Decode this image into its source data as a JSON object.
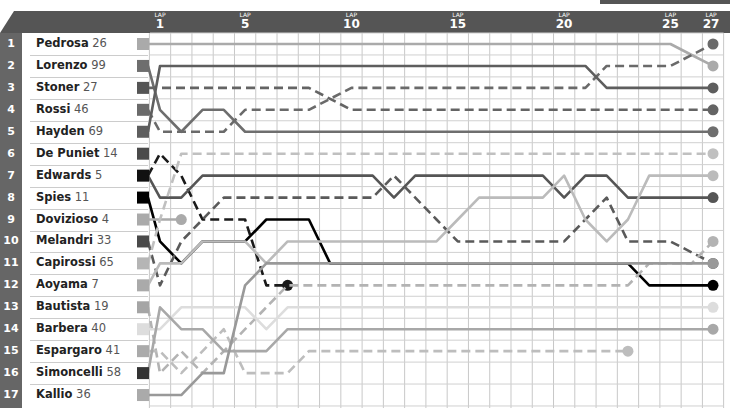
{
  "chart_data": {
    "type": "line",
    "title": "",
    "xlabel": "LAP",
    "ylabel": "Position",
    "x_ticks": [
      1,
      5,
      10,
      15,
      20,
      25,
      27
    ],
    "x_tick_prefix": "LAP",
    "ylim": [
      1,
      17
    ],
    "grid": true,
    "laps": [
      0,
      1,
      2,
      3,
      4,
      5,
      6,
      7,
      8,
      9,
      10,
      11,
      12,
      13,
      14,
      15,
      16,
      17,
      18,
      19,
      20,
      21,
      22,
      23,
      24,
      25,
      26,
      27
    ],
    "series": [
      {
        "name": "Pedrosa",
        "number": "26",
        "grid": 1,
        "color": "#aaaaaa",
        "dash": false,
        "positions": [
          1,
          1,
          1,
          1,
          1,
          1,
          1,
          1,
          1,
          1,
          1,
          1,
          1,
          1,
          1,
          1,
          1,
          1,
          1,
          1,
          1,
          1,
          1,
          1,
          1,
          1,
          1.5,
          2
        ]
      },
      {
        "name": "Lorenzo",
        "number": "99",
        "grid": 2,
        "color": "#6e6e6e",
        "dash": false,
        "positions": [
          2,
          4,
          5,
          4,
          4,
          5,
          5,
          5,
          5,
          5,
          5,
          5,
          5,
          5,
          5,
          5,
          5,
          5,
          5,
          5,
          5,
          5,
          5,
          5,
          5,
          5,
          5,
          5
        ]
      },
      {
        "name": "Stoner",
        "number": "27",
        "grid": 3,
        "color": "#646464",
        "dash": true,
        "positions": [
          3,
          3,
          3,
          3,
          3,
          3,
          3,
          3,
          3,
          3.5,
          4,
          4,
          4,
          4,
          4,
          4,
          4,
          4,
          4,
          4,
          4,
          4,
          4,
          4,
          4,
          4,
          4,
          4
        ]
      },
      {
        "name": "Rossi",
        "number": "46",
        "grid": 4,
        "color": "#6a6a6a",
        "dash": true,
        "positions": [
          4,
          5,
          5,
          5,
          5,
          4,
          4,
          4,
          4,
          3.5,
          3,
          3,
          3,
          3,
          3,
          3,
          3,
          3,
          3,
          3,
          3,
          3,
          2,
          2,
          2,
          2,
          1.5,
          1
        ]
      },
      {
        "name": "Hayden",
        "number": "69",
        "grid": 5,
        "color": "#5e5e5e",
        "dash": false,
        "positions": [
          5,
          2,
          2,
          2,
          2,
          2,
          2,
          2,
          2,
          2,
          2,
          2,
          2,
          2,
          2,
          2,
          2,
          2,
          2,
          2,
          2,
          2,
          3,
          3,
          3,
          3,
          3,
          3
        ]
      },
      {
        "name": "De Puniet",
        "number": "14",
        "grid": 6,
        "color": "#1a1a1a",
        "dash": true,
        "positions": [
          7,
          6,
          7,
          9,
          9,
          9,
          12,
          12,
          null,
          null,
          null,
          null,
          null,
          null,
          null,
          null,
          null,
          null,
          null,
          null,
          null,
          null,
          null,
          null,
          null,
          null,
          null,
          null
        ],
        "retired": true
      },
      {
        "name": "Edwards",
        "number": "5",
        "grid": 7,
        "color": "#555555",
        "dash": false,
        "positions": [
          7,
          8,
          8,
          7,
          7,
          7,
          7,
          7,
          7,
          7,
          7,
          7,
          8,
          7,
          7,
          7,
          7,
          7,
          7,
          7,
          8,
          7,
          7,
          8,
          8,
          8,
          8,
          8
        ]
      },
      {
        "name": "Spies",
        "number": "11",
        "grid": 8,
        "color": "#000000",
        "dash": false,
        "positions": [
          8,
          10,
          11,
          10,
          10,
          10,
          9,
          9,
          9,
          11,
          11,
          11,
          11,
          11,
          11,
          11,
          11,
          11,
          11,
          11,
          11,
          11,
          11,
          11,
          12,
          12,
          12,
          12
        ]
      },
      {
        "name": "Dovizioso",
        "number": "4",
        "grid": 9,
        "color": "#aaaaaa",
        "dash": false,
        "positions": [
          9,
          9,
          9,
          null,
          null,
          null,
          null,
          null,
          null,
          null,
          null,
          null,
          null,
          null,
          null,
          null,
          null,
          null,
          null,
          null,
          null,
          null,
          null,
          null,
          null,
          null,
          null,
          null
        ],
        "retired": true
      },
      {
        "name": "Melandri",
        "number": "33",
        "grid": 10,
        "color": "#5a5a5a",
        "dash": true,
        "positions": [
          10,
          12,
          10,
          9,
          8,
          8,
          8,
          8,
          8,
          8,
          8,
          8,
          7,
          8,
          9,
          10,
          10,
          10,
          10,
          10,
          10,
          9,
          8,
          10,
          10,
          10,
          10.5,
          11
        ]
      },
      {
        "name": "Capirossi",
        "number": "65",
        "grid": 11,
        "color": "#c0c0c0",
        "dash": true,
        "positions": [
          11,
          9,
          6,
          6,
          6,
          6,
          6,
          6,
          6,
          6,
          6,
          6,
          6,
          6,
          6,
          6,
          6,
          6,
          6,
          6,
          6,
          6,
          6,
          6,
          6,
          6,
          6,
          6
        ]
      },
      {
        "name": "Aoyama",
        "number": "7",
        "grid": 12,
        "color": "#bbbbbb",
        "dash": false,
        "positions": [
          12,
          11,
          11,
          10,
          10,
          10,
          11,
          10,
          10,
          10,
          10,
          10,
          10,
          10,
          10,
          9,
          8,
          8,
          8,
          8,
          7,
          9,
          10,
          9,
          7,
          7,
          7,
          7
        ]
      },
      {
        "name": "Bautista",
        "number": "19",
        "grid": 13,
        "color": "#b3b3b3",
        "dash": true,
        "positions": [
          13,
          16,
          15,
          16,
          15,
          14,
          13,
          12,
          12,
          12,
          12,
          12,
          12,
          12,
          12,
          12,
          12,
          12,
          12,
          12,
          12,
          12,
          12,
          12,
          11,
          11,
          11,
          10
        ]
      },
      {
        "name": "Barbera",
        "number": "40",
        "grid": 14,
        "color": "#dddddd",
        "dash": false,
        "positions": [
          14,
          14,
          13,
          13,
          13,
          13,
          14,
          13,
          13,
          13,
          13,
          13,
          13,
          13,
          13,
          13,
          13,
          13,
          13,
          13,
          13,
          13,
          13,
          13,
          13,
          13,
          13,
          13
        ]
      },
      {
        "name": "Espargaro",
        "number": "41",
        "grid": 15,
        "color": "#bdbdbd",
        "dash": true,
        "positions": [
          15,
          15,
          16,
          15,
          14,
          16,
          16,
          16,
          15,
          15,
          15,
          15,
          15,
          15,
          15,
          15,
          15,
          15,
          15,
          15,
          15,
          15,
          15,
          15,
          null,
          null,
          null,
          null
        ],
        "retired": true
      },
      {
        "name": "Simoncelli",
        "number": "58",
        "grid": 16,
        "color": "#a8a8a8",
        "dash": false,
        "positions": [
          16,
          13,
          14,
          14,
          15,
          15,
          15,
          14,
          14,
          14,
          14,
          14,
          14,
          14,
          14,
          14,
          14,
          14,
          14,
          14,
          14,
          14,
          14,
          14,
          14,
          14,
          14,
          14
        ]
      },
      {
        "name": "Kallio",
        "number": "36",
        "grid": 17,
        "color": "#999999",
        "dash": false,
        "positions": [
          17,
          17,
          17,
          16,
          16,
          12,
          11,
          11,
          11,
          11,
          11,
          11,
          11,
          11,
          11,
          11,
          11,
          11,
          11,
          11,
          11,
          11,
          11,
          11,
          11,
          11,
          11,
          11
        ]
      }
    ]
  },
  "header": {
    "lap_label": "LAP"
  },
  "rows": [
    {
      "pos": "1",
      "name": "Pedrosa",
      "number": "26",
      "color": "#aaaaaa"
    },
    {
      "pos": "2",
      "name": "Lorenzo",
      "number": "99",
      "color": "#6e6e6e"
    },
    {
      "pos": "3",
      "name": "Stoner",
      "number": "27",
      "color": "#555555"
    },
    {
      "pos": "4",
      "name": "Rossi",
      "number": "46",
      "color": "#6a6a6a"
    },
    {
      "pos": "5",
      "name": "Hayden",
      "number": "69",
      "color": "#5e5e5e"
    },
    {
      "pos": "6",
      "name": "De Puniet",
      "number": "14",
      "color": "#4a4a4a"
    },
    {
      "pos": "7",
      "name": "Edwards",
      "number": "5",
      "color": "#111111"
    },
    {
      "pos": "8",
      "name": "Spies",
      "number": "11",
      "color": "#000000"
    },
    {
      "pos": "9",
      "name": "Dovizioso",
      "number": "4",
      "color": "#aaaaaa"
    },
    {
      "pos": "10",
      "name": "Melandri",
      "number": "33",
      "color": "#4a4a4a"
    },
    {
      "pos": "11",
      "name": "Capirossi",
      "number": "65",
      "color": "#b5b5b5"
    },
    {
      "pos": "12",
      "name": "Aoyama",
      "number": "7",
      "color": "#aaaaaa"
    },
    {
      "pos": "13",
      "name": "Bautista",
      "number": "19",
      "color": "#a5a5a5"
    },
    {
      "pos": "14",
      "name": "Barbera",
      "number": "40",
      "color": "#dddddd"
    },
    {
      "pos": "15",
      "name": "Espargaro",
      "number": "41",
      "color": "#aaaaaa"
    },
    {
      "pos": "16",
      "name": "Simoncelli",
      "number": "58",
      "color": "#333333"
    },
    {
      "pos": "17",
      "name": "Kallio",
      "number": "36",
      "color": "#aaaaaa"
    }
  ]
}
